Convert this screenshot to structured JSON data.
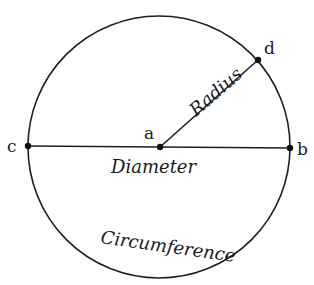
{
  "diagram": {
    "type": "circle-parts",
    "points": {
      "center": {
        "label": "a"
      },
      "right": {
        "label": "b"
      },
      "left": {
        "label": "c"
      },
      "edge": {
        "label": "d"
      }
    },
    "terms": {
      "radius": "Radius",
      "diameter": "Diameter",
      "circumference": "Circumference"
    },
    "colors": {
      "stroke": "#1e1e1e",
      "background": "#ffffff"
    }
  }
}
